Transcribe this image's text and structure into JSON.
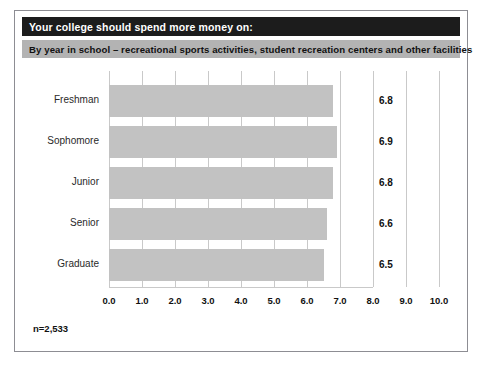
{
  "header": {
    "title": "Your college should spend more money on:",
    "subtitle": "By year in school – recreational sports activities, student recreation centers and other facilities"
  },
  "footnote": "n=2,533",
  "colors": {
    "title_bar_background": "#1c1c1c",
    "title_bar_text": "#ffffff",
    "subtitle_bar_background": "#b3b3b3",
    "subtitle_bar_text": "#111111",
    "bar_fill": "#c2c2c2",
    "grid": "#c9c9c9",
    "frame_border": "#8d8d93",
    "page_background": "#ffffff"
  },
  "chart_data": {
    "type": "bar",
    "orientation": "horizontal",
    "title": "Your college should spend more money on:",
    "subtitle": "By year in school – recreational sports activities, student recreation centers and other facilities",
    "categories": [
      "Freshman",
      "Sophomore",
      "Junior",
      "Senior",
      "Graduate"
    ],
    "values": [
      6.8,
      6.9,
      6.8,
      6.6,
      6.5
    ],
    "value_labels": [
      "6.8",
      "6.9",
      "6.8",
      "6.6",
      "6.5"
    ],
    "xlabel": "",
    "ylabel": "",
    "xlim": [
      0.0,
      10.0
    ],
    "xticks": [
      0.0,
      1.0,
      2.0,
      3.0,
      4.0,
      5.0,
      6.0,
      7.0,
      8.0,
      9.0,
      10.0
    ],
    "xtick_labels": [
      "0.0",
      "1.0",
      "2.0",
      "3.0",
      "4.0",
      "5.0",
      "6.0",
      "7.0",
      "8.0",
      "9.0",
      "10.0"
    ],
    "grid": "vertical gridlines full height at 8.0, 9.0 and 10.0; short tick marks at 0.0–7.0",
    "legend": null,
    "sample_size": "n=2,533"
  }
}
